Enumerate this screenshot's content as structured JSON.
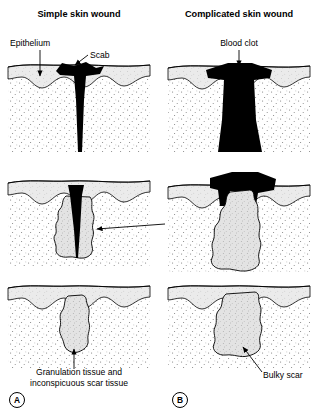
{
  "figure": {
    "kind": "medical-illustration",
    "background_color": "#ffffff",
    "ink_color": "#000000",
    "epidermis_fill": "#ebebeb",
    "dermis_fill": "#ffffff",
    "granulation_fill": "#e3e3e3",
    "clot_fill": "#000000"
  },
  "columns": [
    {
      "id": "A",
      "title": "Simple skin wound",
      "panel_marker": "A",
      "marker_label": "A"
    },
    {
      "id": "B",
      "title": "Complicated skin wound",
      "panel_marker": "B",
      "marker_label": "B"
    }
  ],
  "labels": {
    "epithelium": "Epithelium",
    "scab": "Scab",
    "blood_clot": "Blood clot",
    "granulation_tissue_line1": "Granulation",
    "granulation_tissue_line2": "tissue",
    "scar_simple_line1": "Granulation tissue and",
    "scar_simple_line2": "inconspicuous scar tissue",
    "bulky_scar": "Bulky scar"
  },
  "rows": [
    {
      "stage": 1,
      "left_caption": "Narrow wound filled by scab",
      "right_caption": "Wide wound filled by large blood clot"
    },
    {
      "stage": 2,
      "left_caption": "Thin granulation tissue beside narrow scab",
      "right_caption": "Abundant granulation tissue under clot"
    },
    {
      "stage": 3,
      "left_caption": "Granulation tissue and inconspicuous scar tissue",
      "right_caption": "Bulky scar"
    }
  ]
}
